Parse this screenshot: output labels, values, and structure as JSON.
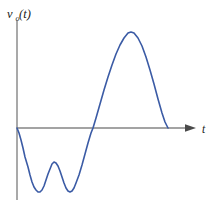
{
  "figure": {
    "kind": "waveform-plot",
    "background_color": "#ffffff",
    "curve_color": "#3b5ba5",
    "axis_color": "#858585",
    "arrow_color": "#4a4a4a"
  },
  "y_axis": {
    "label_variable": "v",
    "label_subscript": "o",
    "label_argument": "(t)",
    "label_full": "vₒ(t)",
    "has_arrowhead": false,
    "x_px": 17,
    "top_px": 20,
    "bottom_px": 200
  },
  "x_axis": {
    "label": "t",
    "has_arrowhead": true,
    "y_px": 128,
    "left_px": 17,
    "right_px": 190
  },
  "chart_data": {
    "type": "line",
    "title": "",
    "subtitle": "",
    "xlabel": "t",
    "ylabel": "vₒ(t)",
    "legend": [],
    "legend_position": "none",
    "grid": false,
    "axis_origin_px": [
      17,
      128
    ],
    "xlim": [
      0,
      10
    ],
    "ylim": [
      -1.05,
      1.6
    ],
    "series": [
      {
        "name": "v_o(t)",
        "color": "#3b5ba5",
        "features": [
          {
            "label": "start-at-origin",
            "x": 0.0,
            "y": 0.0
          },
          {
            "label": "trough-1-minimum",
            "x": 1.15,
            "y": -1.0
          },
          {
            "label": "local-max-between",
            "x": 2.03,
            "y": -0.53
          },
          {
            "label": "trough-2-minimum",
            "x": 2.9,
            "y": -1.0
          },
          {
            "label": "zero-crossing-rising",
            "x": 4.17,
            "y": 0.0
          },
          {
            "label": "global-peak-maximum",
            "x": 6.2,
            "y": 1.5
          },
          {
            "label": "end-at-axis",
            "x": 8.27,
            "y": 0.0
          }
        ],
        "path_points_px": [
          [
            17,
            128
          ],
          [
            19,
            133
          ],
          [
            21,
            140
          ],
          [
            23,
            148
          ],
          [
            25,
            157
          ],
          [
            28,
            167
          ],
          [
            30,
            175
          ],
          [
            32,
            182
          ],
          [
            34,
            187
          ],
          [
            36,
            190
          ],
          [
            38,
            192
          ],
          [
            40,
            192
          ],
          [
            42,
            190
          ],
          [
            44,
            186
          ],
          [
            46,
            180
          ],
          [
            48,
            174
          ],
          [
            50,
            169
          ],
          [
            52,
            164
          ],
          [
            54,
            162
          ],
          [
            56,
            163
          ],
          [
            58,
            166
          ],
          [
            60,
            171
          ],
          [
            62,
            177
          ],
          [
            64,
            183
          ],
          [
            66,
            188
          ],
          [
            68,
            191
          ],
          [
            70,
            192
          ],
          [
            72,
            191
          ],
          [
            74,
            188
          ],
          [
            76,
            183
          ],
          [
            79,
            175
          ],
          [
            82,
            165
          ],
          [
            85,
            154
          ],
          [
            88,
            143
          ],
          [
            91,
            133
          ],
          [
            93,
            128
          ],
          [
            96,
            118
          ],
          [
            100,
            104
          ],
          [
            104,
            90
          ],
          [
            108,
            77
          ],
          [
            112,
            65
          ],
          [
            116,
            54
          ],
          [
            120,
            45
          ],
          [
            124,
            38
          ],
          [
            128,
            33
          ],
          [
            131,
            32
          ],
          [
            134,
            33
          ],
          [
            138,
            38
          ],
          [
            142,
            46
          ],
          [
            146,
            57
          ],
          [
            150,
            70
          ],
          [
            154,
            84
          ],
          [
            158,
            99
          ],
          [
            162,
            113
          ],
          [
            165,
            122
          ],
          [
            168,
            128
          ]
        ]
      }
    ]
  }
}
